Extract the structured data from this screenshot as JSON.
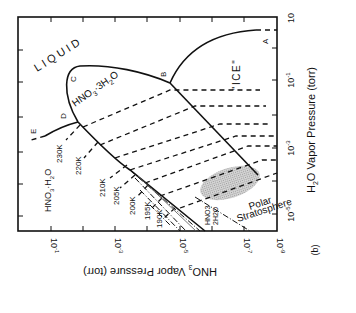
{
  "figure": {
    "panel_label": "(b)",
    "x_axis": {
      "title": "HNO3 Vapor Pressure (torr)",
      "ticks": [
        "10^-1",
        "10^-3",
        "10^-5",
        "10^-7",
        "10^-9"
      ]
    },
    "y_axis": {
      "title": "H2O Vapor Pressure (torr)",
      "ticks": [
        "10",
        "10^-1",
        "10^-3",
        "10^-5"
      ]
    },
    "regions": {
      "liquid": "LIQUID",
      "ice": "\"ICE\"",
      "nat": "HNO3·3H2O",
      "nam": "HNO3·H2O",
      "nad": "HNO3·2H2O",
      "polar": [
        "Polar",
        "Stratosphere"
      ]
    },
    "points": [
      "A",
      "B",
      "C",
      "D",
      "E"
    ],
    "isotherms": [
      "230K",
      "220K",
      "210K",
      "205K",
      "200K",
      "195K",
      "190K"
    ]
  },
  "text": {
    "liquid": "LIQUID",
    "ice": "\"ICE\"",
    "nat_main": "HNO",
    "nat_sub": "3",
    "nat_rest": "·3H",
    "nat_sub2": "2",
    "nat_o": "O",
    "nam_main": "HNO",
    "nam_sub": "3",
    "nam_rest": "·H",
    "nam_sub2": "2",
    "nam_o": "O",
    "nad_l1": "HNO3",
    "nad_l2": "2H2O",
    "polar_l1": "Polar",
    "polar_l2": "Stratosphere",
    "pA": "A",
    "pB": "B",
    "pC": "C",
    "pD": "D",
    "pE": "E",
    "t230": "230K",
    "t220": "220K",
    "t210": "210K",
    "t205": "205K",
    "t200": "200K",
    "t195": "195K",
    "t190": "190K",
    "xt1": "10",
    "xt1e": "-1",
    "xt3": "10",
    "xt3e": "-3",
    "xt5": "10",
    "xt5e": "-5",
    "xt7": "10",
    "xt7e": "-7",
    "xt9": "10",
    "xt9e": "-9",
    "xtitle_a": "HNO",
    "xtitle_sub": "3",
    "xtitle_b": " Vapor Pressure (torr)",
    "yt10": "10",
    "yt1": "10",
    "yt1e": "-1",
    "yt3": "10",
    "yt3e": "-3",
    "yt5": "10",
    "yt5e": "-5",
    "ytitle_a": "H",
    "ytitle_sub": "2",
    "ytitle_b": "O Vapor Pressure (torr)",
    "panel": "(b)"
  },
  "colors": {
    "ink": "#111111",
    "stipple": "#b9b9b9",
    "background": "#ffffff"
  }
}
